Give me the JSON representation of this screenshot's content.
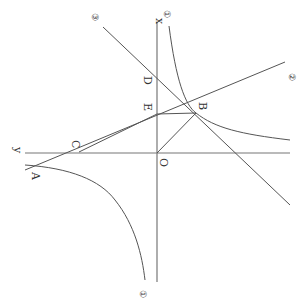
{
  "diagram": {
    "orientation": "rotated 90 degrees (x-axis vertical up, y-axis horizontal left)",
    "colors": {
      "line": "#555555",
      "axis": "#777777",
      "text": "#333333",
      "background": "#ffffff"
    },
    "axes": {
      "x_label": "x",
      "y_label": "y",
      "origin_label": "O"
    },
    "points": [
      {
        "name": "A",
        "label": "A"
      },
      {
        "name": "B",
        "label": "B"
      },
      {
        "name": "C",
        "label": "C"
      },
      {
        "name": "D",
        "label": "D"
      },
      {
        "name": "E",
        "label": "E"
      },
      {
        "name": "O",
        "label": "O"
      }
    ],
    "curves": [
      {
        "id": "1",
        "label": "①",
        "type": "hyperbola (two branches)"
      },
      {
        "id": "2",
        "label": "②",
        "type": "line through A, C, B"
      },
      {
        "id": "3",
        "label": "③",
        "type": "line through D, B"
      }
    ],
    "segments": [
      "E-B",
      "C-E",
      "C-B",
      "O-B"
    ]
  }
}
